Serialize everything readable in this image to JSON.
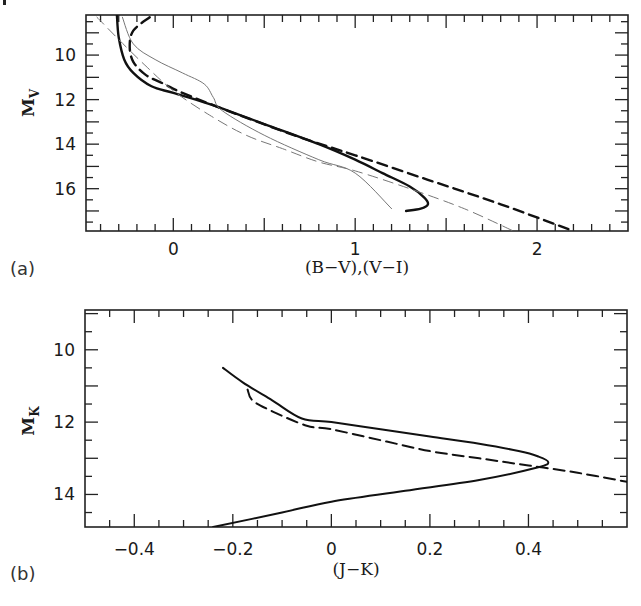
{
  "chart_data": [
    {
      "type": "line",
      "panel_label": "(a)",
      "title": "",
      "xlabel": "(B-V),(V-I)",
      "ylabel": "M_V",
      "ylabel_main": "M",
      "ylabel_sub": "V",
      "xlim": [
        -0.48,
        2.5
      ],
      "ylim": [
        17.9,
        8.2
      ],
      "y_inverted": true,
      "xticks": [
        0,
        1,
        2
      ],
      "xtick_labels": [
        "0",
        "1",
        "2"
      ],
      "yticks": [
        10,
        12,
        14,
        16
      ],
      "ytick_labels": [
        "10",
        "12",
        "14",
        "16"
      ],
      "grid": false,
      "legend": null,
      "series": [
        {
          "name": "heavy-solid",
          "style": "solid",
          "weight": "heavy",
          "x": [
            -0.31,
            -0.3,
            -0.27,
            -0.22,
            -0.12,
            0.0,
            0.2,
            0.5,
            0.8,
            1.0,
            1.15,
            1.3,
            1.38,
            1.4,
            1.36,
            1.28
          ],
          "y": [
            8.2,
            9.2,
            10.2,
            10.8,
            11.4,
            11.7,
            12.2,
            13.1,
            14.0,
            14.7,
            15.3,
            15.9,
            16.4,
            16.7,
            16.9,
            17.0
          ]
        },
        {
          "name": "heavy-dashed",
          "style": "dashed",
          "weight": "heavy",
          "x": [
            -0.13,
            -0.22,
            -0.24,
            -0.22,
            -0.15,
            -0.05,
            0.05,
            0.3,
            0.7,
            1.0,
            1.4,
            1.8,
            2.2
          ],
          "y": [
            8.3,
            8.9,
            9.6,
            10.3,
            10.9,
            11.3,
            11.7,
            12.5,
            13.7,
            14.5,
            15.6,
            16.7,
            17.9
          ]
        },
        {
          "name": "thin-solid",
          "style": "solid",
          "weight": "thin",
          "x": [
            -0.28,
            -0.22,
            -0.1,
            0.05,
            0.17,
            0.22,
            0.27,
            0.5,
            0.8,
            1.0,
            1.2
          ],
          "y": [
            8.3,
            9.5,
            10.2,
            10.8,
            11.3,
            11.9,
            12.5,
            13.6,
            14.7,
            15.3,
            16.9
          ]
        },
        {
          "name": "thin-dashed",
          "style": "dashed",
          "weight": "thin",
          "x": [
            -0.42,
            -0.3,
            -0.15,
            0.0,
            0.2,
            0.4,
            0.6,
            0.8,
            1.0,
            1.3,
            1.6,
            1.87
          ],
          "y": [
            8.3,
            9.3,
            10.5,
            11.6,
            12.7,
            13.6,
            14.2,
            14.8,
            15.2,
            16.0,
            16.9,
            17.9
          ]
        }
      ]
    },
    {
      "type": "line",
      "panel_label": "(b)",
      "title": "",
      "xlabel": "(J-K)",
      "ylabel": "M_K",
      "ylabel_main": "M",
      "ylabel_sub": "K",
      "xlim": [
        -0.5,
        0.6
      ],
      "ylim": [
        14.9,
        8.9
      ],
      "y_inverted": true,
      "xticks": [
        -0.4,
        -0.2,
        0,
        0.2,
        0.4
      ],
      "xtick_labels": [
        "-0.4",
        "-0.2",
        "0",
        "0.2",
        "0.4"
      ],
      "yticks": [
        10,
        12,
        14
      ],
      "ytick_labels": [
        "10",
        "12",
        "14"
      ],
      "grid": false,
      "legend": null,
      "series": [
        {
          "name": "solid",
          "style": "solid",
          "x": [
            -0.22,
            -0.18,
            -0.12,
            -0.06,
            0.0,
            0.1,
            0.2,
            0.3,
            0.38,
            0.42,
            0.44,
            0.42,
            0.3,
            0.15,
            0.0,
            -0.1,
            -0.24
          ],
          "y": [
            10.5,
            10.9,
            11.4,
            11.9,
            12.0,
            12.2,
            12.4,
            12.6,
            12.8,
            12.95,
            13.1,
            13.25,
            13.6,
            13.9,
            14.2,
            14.5,
            14.9
          ]
        },
        {
          "name": "dashed",
          "style": "dashed",
          "x": [
            -0.17,
            -0.16,
            -0.12,
            -0.05,
            0.0,
            0.1,
            0.2,
            0.3,
            0.4,
            0.5,
            0.6
          ],
          "y": [
            11.1,
            11.4,
            11.7,
            12.1,
            12.2,
            12.5,
            12.8,
            13.0,
            13.2,
            13.4,
            13.65
          ]
        }
      ]
    }
  ]
}
